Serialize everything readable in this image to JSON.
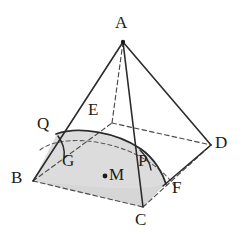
{
  "figure": {
    "kind": "solid-geometry-diagram",
    "canvas": {
      "width": 247,
      "height": 238
    },
    "colors": {
      "background": "#ffffff",
      "stroke": "#2b2b2b",
      "dashed_stroke": "#4a4a4a",
      "shade_fill": "#dcdcdc",
      "label": "#1b1b1b"
    }
  },
  "labels": {
    "apex": {
      "text": "A",
      "x": 115,
      "y": 14
    },
    "back_base": {
      "text": "E",
      "x": 88,
      "y": 101
    },
    "left_section": {
      "text": "Q",
      "x": 37,
      "y": 115
    },
    "right_base": {
      "text": "D",
      "x": 215,
      "y": 134
    },
    "arc_left": {
      "text": "G",
      "x": 62,
      "y": 152
    },
    "arc_right": {
      "text": "P",
      "x": 138,
      "y": 152
    },
    "left_base": {
      "text": "B",
      "x": 11,
      "y": 169
    },
    "center": {
      "text": "M",
      "x": 109,
      "y": 166
    },
    "front_right": {
      "text": "F",
      "x": 172,
      "y": 179
    },
    "front_base": {
      "text": "C",
      "x": 135,
      "y": 211
    }
  },
  "points": {
    "A": {
      "x": 123,
      "y": 42
    },
    "B": {
      "x": 33,
      "y": 181
    },
    "C": {
      "x": 143,
      "y": 207
    },
    "D": {
      "x": 211,
      "y": 145
    },
    "E": {
      "x": 112,
      "y": 123
    },
    "M": {
      "x": 105,
      "y": 176
    },
    "Q": {
      "x": 57,
      "y": 134
    },
    "P": {
      "x": 146,
      "y": 163
    },
    "F": {
      "x": 166,
      "y": 183
    },
    "G": {
      "x": 74,
      "y": 158
    }
  },
  "edges": [
    {
      "name": "A-B",
      "from": "A",
      "to": "B",
      "style": "solid"
    },
    {
      "name": "A-C",
      "from": "A",
      "to": "C",
      "style": "solid"
    },
    {
      "name": "A-D",
      "from": "A",
      "to": "D",
      "style": "solid"
    },
    {
      "name": "A-E",
      "from": "A",
      "to": "E",
      "style": "dashed"
    },
    {
      "name": "B-E",
      "from": "B",
      "to": "E",
      "style": "dashed"
    },
    {
      "name": "E-D",
      "from": "E",
      "to": "D",
      "style": "dashed"
    },
    {
      "name": "B-C",
      "from": "B",
      "to": "C",
      "style": "dashed"
    },
    {
      "name": "C-D",
      "from": "C",
      "to": "D",
      "style": "dashed"
    },
    {
      "name": "D-F",
      "from": "D",
      "to": "F",
      "style": "solid"
    }
  ],
  "curves": {
    "upper_section_arc": "solid arc from Q over the top passing near P and ending at F",
    "lower_dashed_ellipse": "dashed elliptical arc inside the base from B-side to D-side",
    "small_angle_arc_at_Q": "small solid arc marking the angle at Q",
    "shaded_region": "grey filled region bounded above by the curved section and below by base edge B-C"
  },
  "center_dot": {
    "name": "M",
    "x": 105,
    "y": 176,
    "radius": 2.4
  },
  "apex_dot": {
    "name": "A",
    "x": 123,
    "y": 42,
    "radius": 2.2
  }
}
